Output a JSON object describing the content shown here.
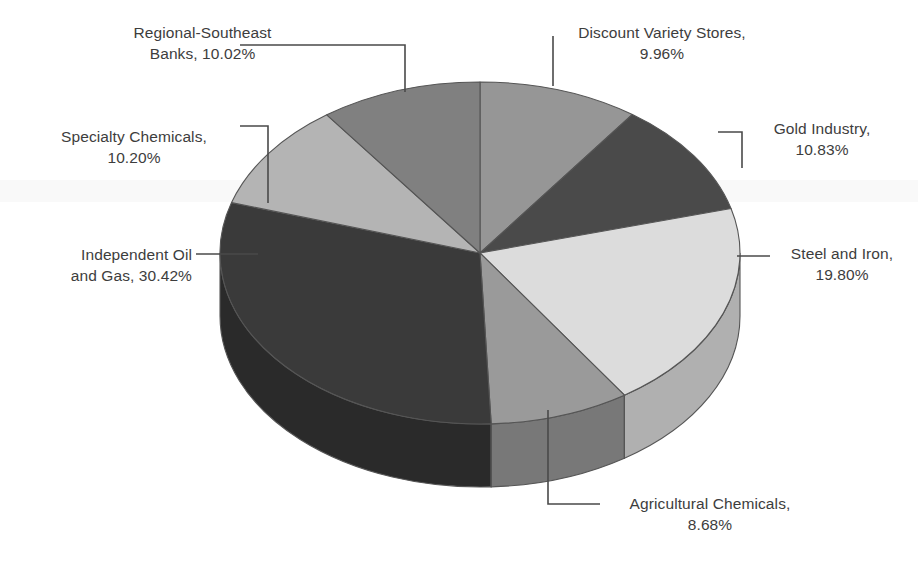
{
  "chart_data": {
    "type": "pie",
    "title": "",
    "subtitle": "",
    "xlabel": "",
    "ylabel": "",
    "legend_position": "none",
    "grid": false,
    "style": "3d-exploded-none",
    "units": "percent",
    "start_angle_deg": 0,
    "direction": "clockwise",
    "center": {
      "x": 480,
      "y": 253
    },
    "radius_x": 260,
    "radius_y": 171,
    "depth": 63,
    "categories": [
      "Discount Variety Stores",
      "Gold Industry",
      "Steel and Iron",
      "Agricultural Chemicals",
      "Independent Oil and Gas",
      "Specialty Chemicals",
      "Regional-Southeast Banks"
    ],
    "values": [
      9.96,
      10.83,
      19.8,
      8.68,
      30.42,
      10.2,
      10.02
    ],
    "colors": [
      "#969696",
      "#4a4a4a",
      "#dcdcdc",
      "#9a9a9a",
      "#3a3a3a",
      "#b4b4b4",
      "#808080"
    ],
    "side_colors": [
      "#6e6e6e",
      "#383838",
      "#b0b0b0",
      "#787878",
      "#2a2a2a",
      "#8c8c8c",
      "#5e5e5e"
    ],
    "slices": [
      {
        "label": "Discount Variety Stores",
        "value": 9.96,
        "value_text": "9.96%",
        "color": "#969696"
      },
      {
        "label": "Gold Industry",
        "value": 10.83,
        "value_text": "10.83%",
        "color": "#4a4a4a"
      },
      {
        "label": "Steel and Iron",
        "value": 19.8,
        "value_text": "19.80%",
        "color": "#dcdcdc"
      },
      {
        "label": "Agricultural Chemicals",
        "value": 8.68,
        "value_text": "8.68%",
        "color": "#9a9a9a"
      },
      {
        "label": "Independent Oil and Gas",
        "value": 30.42,
        "value_text": "30.42%",
        "color": "#3a3a3a"
      },
      {
        "label": "Specialty Chemicals",
        "value": 10.2,
        "value_text": "10.20%",
        "color": "#b4b4b4"
      },
      {
        "label": "Regional-Southeast Banks",
        "value": 10.02,
        "value_text": "10.02%",
        "color": "#808080"
      }
    ]
  },
  "labels": {
    "regional_southeast_banks": "Regional-Southeast\nBanks, 10.02%",
    "discount_variety_stores": "Discount Variety Stores,\n9.96%",
    "gold_industry": "Gold Industry,\n10.83%",
    "steel_and_iron": "Steel and Iron,\n19.80%",
    "agricultural_chemicals": "Agricultural Chemicals,\n8.68%",
    "independent_oil_and_gas": "Independent Oil\nand Gas, 30.42%",
    "specialty_chemicals": "Specialty Chemicals,\n10.20%"
  },
  "appearance": {
    "background": "#ffffff",
    "text_color": "#3d3d3d",
    "leader_line_color": "#4a4a4a",
    "slice_outline_color": "#555555"
  }
}
